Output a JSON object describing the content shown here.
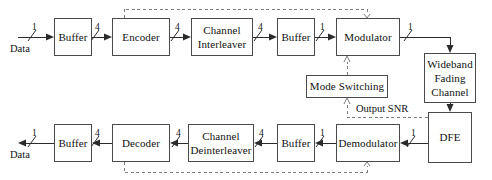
{
  "diagram": {
    "type": "block-diagram",
    "canvas": {
      "width": 492,
      "height": 180,
      "background": "#ffffff"
    },
    "colors": {
      "solid_line": "#2b2b2b",
      "dashed_line": "#7d7d7d",
      "box_border": "#4a4a4a",
      "text": "#111111",
      "background": "#ffffff"
    },
    "nodes": [
      {
        "id": "tx_buffer",
        "label": "Buffer",
        "x": 54,
        "y": 18,
        "w": 38,
        "h": 38
      },
      {
        "id": "encoder",
        "label": "Encoder",
        "x": 112,
        "y": 18,
        "w": 58,
        "h": 38
      },
      {
        "id": "interleaver",
        "label": "Channel\nInterleaver",
        "x": 191,
        "y": 18,
        "w": 62,
        "h": 38
      },
      {
        "id": "tx_buffer2",
        "label": "Buffer",
        "x": 277,
        "y": 18,
        "w": 38,
        "h": 38
      },
      {
        "id": "modulator",
        "label": "Modulator",
        "x": 336,
        "y": 18,
        "w": 64,
        "h": 38
      },
      {
        "id": "fading_channel",
        "label": "Wideband\nFading\nChannel",
        "x": 424,
        "y": 53,
        "w": 52,
        "h": 50
      },
      {
        "id": "dfe",
        "label": "DFE",
        "x": 428,
        "y": 112,
        "w": 44,
        "h": 51
      },
      {
        "id": "mode_switching",
        "label": "Mode Switching",
        "x": 306,
        "y": 75,
        "w": 82,
        "h": 23
      },
      {
        "id": "demodulator",
        "label": "Demodulator",
        "x": 336,
        "y": 124,
        "w": 64,
        "h": 38
      },
      {
        "id": "rx_buffer2",
        "label": "Buffer",
        "x": 277,
        "y": 124,
        "w": 38,
        "h": 38
      },
      {
        "id": "deinterleaver",
        "label": "Channel\nDeinterleaver",
        "x": 188,
        "y": 124,
        "w": 66,
        "h": 38
      },
      {
        "id": "decoder",
        "label": "Decoder",
        "x": 112,
        "y": 124,
        "w": 58,
        "h": 38
      },
      {
        "id": "rx_buffer",
        "label": "Buffer",
        "x": 54,
        "y": 124,
        "w": 38,
        "h": 38
      }
    ],
    "port_labels": [
      {
        "id": "tx_data_in",
        "text": "Data",
        "x": 10,
        "y": 43
      },
      {
        "id": "rx_data_out",
        "text": "Data",
        "x": 10,
        "y": 149
      }
    ],
    "flow_labels": [
      {
        "id": "output_snr",
        "text": "Output SNR",
        "x": 338,
        "y": 104
      }
    ],
    "edge_labels": [
      {
        "id": "tx_in_rate",
        "text": "1",
        "x": 32,
        "y": 22
      },
      {
        "id": "tx_buffer_out_rate",
        "text": "4",
        "x": 95,
        "y": 22
      },
      {
        "id": "encoder_out_rate",
        "text": "4",
        "x": 175,
        "y": 22
      },
      {
        "id": "interleaver_out_rate",
        "text": "4",
        "x": 258,
        "y": 22
      },
      {
        "id": "tx_buffer2_out_rate",
        "text": "1",
        "x": 320,
        "y": 22
      },
      {
        "id": "modulator_out_rate",
        "text": "1",
        "x": 411,
        "y": 22
      },
      {
        "id": "rx_out_rate",
        "text": "1",
        "x": 32,
        "y": 128
      },
      {
        "id": "decoder_out_rate",
        "text": "4",
        "x": 95,
        "y": 128
      },
      {
        "id": "deinterleaver_out_rate",
        "text": "4",
        "x": 259,
        "y": 128
      },
      {
        "id": "rx_buffer2_in_rate",
        "text": "4",
        "x": 176,
        "y": 128
      },
      {
        "id": "demod_out_rate",
        "text": "1",
        "x": 320,
        "y": 128
      },
      {
        "id": "dfe_out_rate",
        "text": "1",
        "x": 411,
        "y": 128
      }
    ]
  }
}
